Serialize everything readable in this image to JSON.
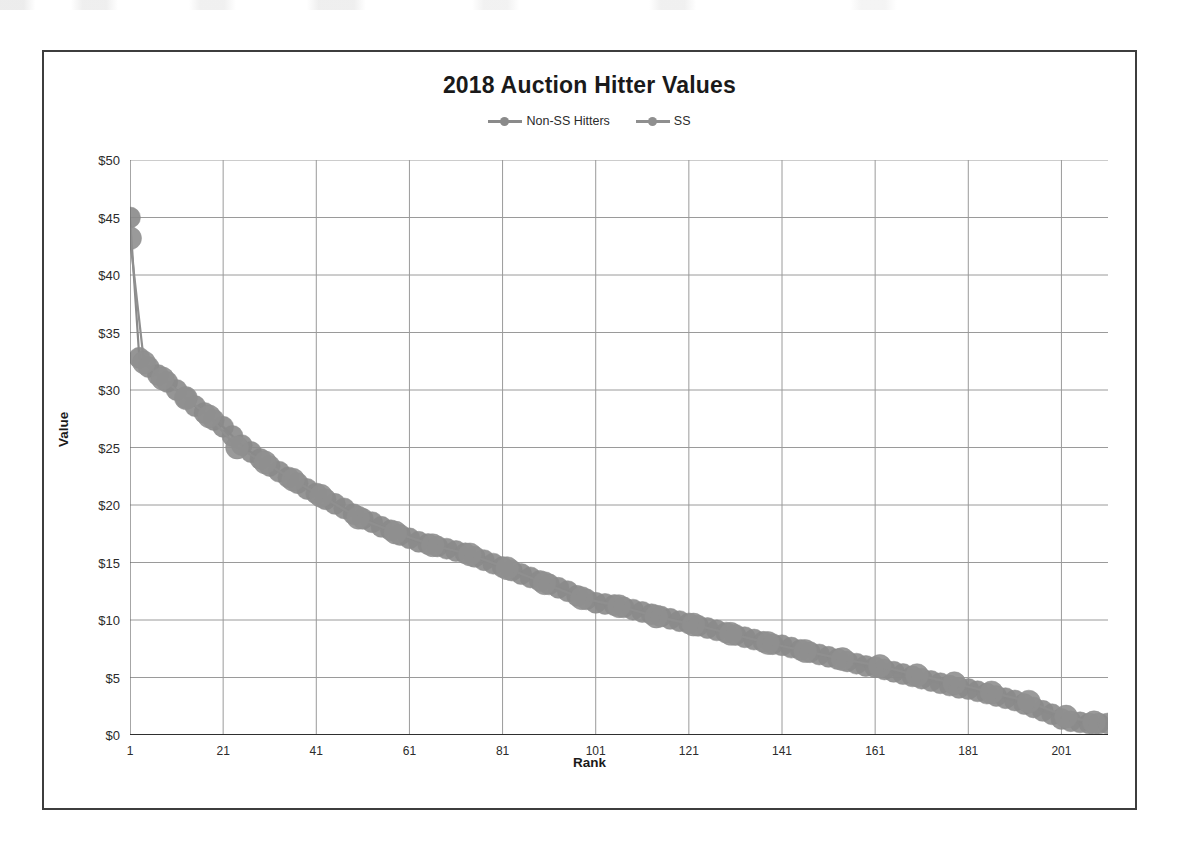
{
  "chart_data": {
    "type": "line",
    "title": "2018 Auction Hitter Values",
    "xlabel": "Rank",
    "ylabel": "Value",
    "xlim": [
      1,
      211
    ],
    "ylim": [
      0,
      50
    ],
    "grid": true,
    "legend_position": "top-center",
    "x_ticks": [
      "1",
      "21",
      "41",
      "61",
      "81",
      "101",
      "121",
      "141",
      "161",
      "181",
      "201"
    ],
    "x_tick_values": [
      1,
      21,
      41,
      61,
      81,
      101,
      121,
      141,
      161,
      181,
      201
    ],
    "y_ticks": [
      "$0",
      "$5",
      "$10",
      "$15",
      "$20",
      "$25",
      "$30",
      "$35",
      "$40",
      "$45",
      "$50"
    ],
    "y_tick_values": [
      0,
      5,
      10,
      15,
      20,
      25,
      30,
      35,
      40,
      45,
      50
    ],
    "series": [
      {
        "name": "Non-SS Hitters",
        "color": "#8a8a8a",
        "marker": "circle",
        "x": [
          1,
          3,
          5,
          7,
          9,
          11,
          13,
          15,
          17,
          19,
          21,
          23,
          25,
          27,
          29,
          31,
          33,
          35,
          37,
          39,
          41,
          43,
          45,
          47,
          49,
          51,
          53,
          55,
          57,
          59,
          61,
          63,
          65,
          67,
          69,
          71,
          73,
          75,
          77,
          79,
          81,
          83,
          85,
          87,
          89,
          91,
          93,
          95,
          97,
          99,
          101,
          103,
          105,
          107,
          109,
          111,
          113,
          115,
          117,
          119,
          121,
          123,
          125,
          127,
          129,
          131,
          133,
          135,
          137,
          139,
          141,
          143,
          145,
          147,
          149,
          151,
          153,
          155,
          157,
          159,
          161,
          163,
          165,
          167,
          169,
          171,
          173,
          175,
          177,
          179,
          181,
          183,
          185,
          187,
          189,
          191,
          193,
          195,
          197,
          199,
          201,
          203,
          205,
          207,
          209,
          211
        ],
        "y": [
          45.0,
          32.8,
          32.0,
          31.3,
          30.7,
          30.0,
          29.3,
          28.6,
          28.0,
          27.4,
          26.8,
          26.0,
          25.2,
          24.6,
          24.0,
          23.4,
          22.9,
          22.4,
          21.9,
          21.4,
          21.0,
          20.5,
          20.1,
          19.7,
          19.2,
          18.8,
          18.5,
          18.1,
          17.8,
          17.4,
          17.1,
          16.8,
          16.6,
          16.4,
          16.2,
          16.0,
          15.8,
          15.5,
          15.2,
          14.9,
          14.6,
          14.3,
          14.0,
          13.7,
          13.4,
          13.1,
          12.8,
          12.5,
          12.1,
          11.8,
          11.5,
          11.4,
          11.3,
          11.1,
          10.9,
          10.7,
          10.5,
          10.3,
          10.1,
          9.9,
          9.7,
          9.5,
          9.3,
          9.1,
          8.9,
          8.7,
          8.5,
          8.3,
          8.1,
          7.9,
          7.8,
          7.6,
          7.4,
          7.2,
          7.0,
          6.8,
          6.6,
          6.4,
          6.2,
          6.0,
          5.9,
          5.7,
          5.5,
          5.3,
          5.1,
          4.9,
          4.7,
          4.5,
          4.3,
          4.1,
          4.0,
          3.8,
          3.6,
          3.4,
          3.2,
          3.0,
          2.7,
          2.4,
          2.1,
          1.8,
          1.4,
          1.2,
          1.1,
          1.0,
          1.0,
          1.0
        ]
      },
      {
        "name": "SS",
        "color": "#8f8f8f",
        "marker": "circle",
        "x": [
          1,
          4,
          8,
          13,
          18,
          24,
          30,
          36,
          42,
          50,
          58,
          66,
          74,
          82,
          90,
          98,
          106,
          114,
          122,
          130,
          138,
          146,
          154,
          162,
          170,
          178,
          186,
          194,
          202,
          208
        ],
        "y": [
          43.2,
          32.4,
          31.0,
          29.3,
          27.7,
          25.0,
          23.7,
          22.2,
          20.8,
          18.9,
          17.6,
          16.5,
          15.7,
          14.5,
          13.2,
          11.9,
          11.2,
          10.3,
          9.6,
          8.8,
          8.0,
          7.3,
          6.6,
          6.0,
          5.2,
          4.5,
          3.7,
          2.9,
          1.6,
          1.1
        ]
      }
    ]
  }
}
